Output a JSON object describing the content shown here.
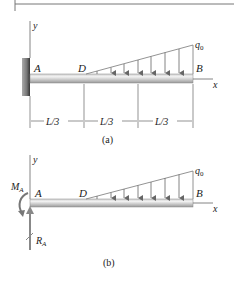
{
  "figure_a": {
    "caption": "(a)",
    "axis_y": "y",
    "axis_x": "x",
    "point_a": "A",
    "point_d": "D",
    "point_b": "B",
    "load_label": "q",
    "load_sub": "0",
    "dimensions": [
      "L/3",
      "L/3",
      "L/3"
    ],
    "support": "fixed-wall"
  },
  "figure_b": {
    "caption": "(b)",
    "axis_y": "y",
    "axis_x": "x",
    "point_a": "A",
    "point_d": "D",
    "point_b": "B",
    "load_label": "q",
    "load_sub": "0",
    "moment_label": "M",
    "moment_sub": "A",
    "reaction_label": "R",
    "reaction_sub": "A"
  },
  "colors": {
    "beam_light": "#e8e8e8",
    "beam_dark": "#9a9a9a",
    "wall": "#555555",
    "line": "#555555",
    "arrow": "#666666"
  }
}
